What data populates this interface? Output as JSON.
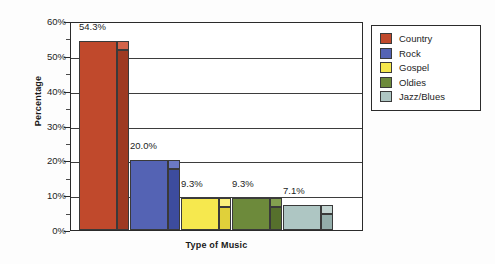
{
  "chart_data": {
    "type": "bar",
    "title": "",
    "xlabel": "Type of Music",
    "ylabel": "Percentage",
    "categories": [
      "Country",
      "Rock",
      "Gospel",
      "Oldies",
      "Jazz/Blues"
    ],
    "values": [
      54.3,
      20.0,
      9.3,
      9.3,
      7.1
    ],
    "data_labels": [
      "54.3%",
      "20.0%",
      "9.3%",
      "9.3%",
      "7.1%"
    ],
    "ylim": [
      0,
      60
    ],
    "ytick_labels": [
      "60%",
      "50%",
      "40%",
      "30%",
      "20%",
      "10%",
      "0%"
    ],
    "ytick_values": [
      60,
      50,
      40,
      30,
      20,
      10,
      0
    ],
    "minor_tick_values": [
      55,
      45,
      35,
      25,
      15,
      5
    ],
    "grid": "horizontal",
    "legend_position": "right",
    "style": "3d-column",
    "series_colors": [
      "#c0492c",
      "#5463b4",
      "#f6e84e",
      "#6d8a3b",
      "#aec6c3"
    ],
    "legend": [
      {
        "label": "Country",
        "color": "#c0492c",
        "side": "#9e3a22",
        "top": "#d4644a"
      },
      {
        "label": "Rock",
        "color": "#5463b4",
        "side": "#3d4c9e",
        "top": "#6b79c4"
      },
      {
        "label": "Gospel",
        "color": "#f6e84e",
        "side": "#e0d03a",
        "top": "#faf07d"
      },
      {
        "label": "Oldies",
        "color": "#6d8a3b",
        "side": "#56702c",
        "top": "#83a04f"
      },
      {
        "label": "Jazz/Blues",
        "color": "#aec6c3",
        "side": "#94aeab",
        "top": "#c3d5d2"
      }
    ]
  }
}
